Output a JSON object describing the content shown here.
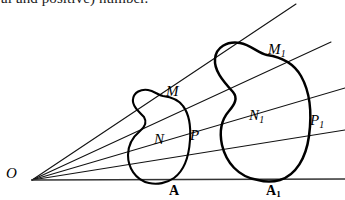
{
  "page": {
    "width": 345,
    "height": 200,
    "background": "#ffffff",
    "ink_color": "#000000"
  },
  "text_fragment": {
    "name": "clipped-body-text",
    "content": "al and positive) number.",
    "note_visible": "partially cropped bottom half of a text line"
  },
  "figure": {
    "kind": "geometry-diagram",
    "vertex": {
      "label": "O",
      "x": 32,
      "y": 180
    },
    "rays": [
      {
        "name": "ray-baseline",
        "from": [
          32,
          180
        ],
        "to": [
          345,
          179
        ]
      },
      {
        "name": "ray-1",
        "from": [
          32,
          180
        ],
        "to": [
          345,
          130
        ]
      },
      {
        "name": "ray-2",
        "from": [
          32,
          180
        ],
        "to": [
          345,
          88
        ]
      },
      {
        "name": "ray-3",
        "from": [
          32,
          180
        ],
        "to": [
          331,
          42
        ]
      },
      {
        "name": "ray-4",
        "from": [
          32,
          180
        ],
        "to": [
          296,
          4
        ]
      }
    ],
    "labels": [
      {
        "name": "label-O",
        "text": "O",
        "style": "italic",
        "x": 6,
        "y": 170
      },
      {
        "name": "label-M",
        "text": "M",
        "style": "italic",
        "x": 166,
        "y": 89
      },
      {
        "name": "label-N",
        "text": "N",
        "style": "italic",
        "x": 154,
        "y": 137
      },
      {
        "name": "label-P",
        "text": "P",
        "style": "italic",
        "x": 190,
        "y": 133
      },
      {
        "name": "label-M1",
        "text": "M",
        "sub": "1",
        "style": "italic",
        "x": 268,
        "y": 47
      },
      {
        "name": "label-N1",
        "text": "N",
        "sub": "1",
        "style": "italic",
        "x": 249,
        "y": 113
      },
      {
        "name": "label-P1",
        "text": "P",
        "sub": "1",
        "style": "italic",
        "x": 310,
        "y": 118
      },
      {
        "name": "label-A",
        "text": "A",
        "style": "bold",
        "x": 169,
        "y": 183
      },
      {
        "name": "label-A1",
        "text": "A",
        "sub": "1",
        "style": "bold",
        "x": 266,
        "y": 183
      }
    ],
    "regions": [
      {
        "name": "region-A",
        "label": "A",
        "size": "small",
        "path": "M 149 183 C 135 180 128 167 128 155 C 128 144 134 136 140 131 C 145 127 147 122 144 117 C 137 110 132 105 133 99 C 134 92 141 89 148 90 C 154 91 158 95 163 96 C 171 97 178 99 183 106 C 189 114 191 126 190 140 C 189 155 185 170 174 178 C 167 183 157 185 149 183 Z"
      },
      {
        "name": "region-A1",
        "label": "A1",
        "size": "large",
        "path": "M 258 180 C 238 177 226 162 222 145 C 219 131 222 119 229 111 C 235 104 238 98 233 92 C 222 80 214 70 215 59 C 216 47 227 41 240 43 C 251 45 258 53 267 55 C 281 57 293 62 301 76 C 310 92 312 114 309 136 C 306 158 296 175 280 180 C 273 182 265 182 258 180 Z"
      }
    ]
  }
}
